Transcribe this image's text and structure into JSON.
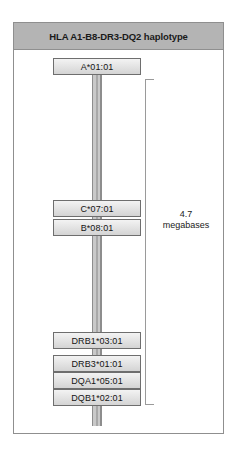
{
  "figure": {
    "header": {
      "title": "HLA A1-B8-DR3-DQ2 haplotype"
    },
    "chromosome": {
      "name": "chromosome-6-mhc-bar"
    },
    "alleles": [
      {
        "id": "hla-a",
        "label": "A*01:01",
        "top": 57
      },
      {
        "id": "hla-c",
        "label": "C*07:01",
        "top": 199
      },
      {
        "id": "hla-b",
        "label": "B*08:01",
        "top": 218
      },
      {
        "id": "hla-drb1",
        "label": "DRB1*03:01",
        "top": 331
      },
      {
        "id": "hla-drb3",
        "label": "DRB3*01:01",
        "top": 354
      },
      {
        "id": "hla-dqa1",
        "label": "DQA1*05:01",
        "top": 371
      },
      {
        "id": "hla-dqb1",
        "label": "DQB1*02:01",
        "top": 388
      }
    ],
    "scale": {
      "value": "4.7",
      "unit": "megabases"
    },
    "colors": {
      "header_band": "#b4b4b4",
      "frame_border": "#8f8f8f",
      "box_border": "#6e6e6e",
      "box_fill": "#e2e2e2",
      "bar_gray": "#a8a8a8",
      "bracket": "#9a9a9a",
      "text": "#1a1a1a"
    }
  }
}
